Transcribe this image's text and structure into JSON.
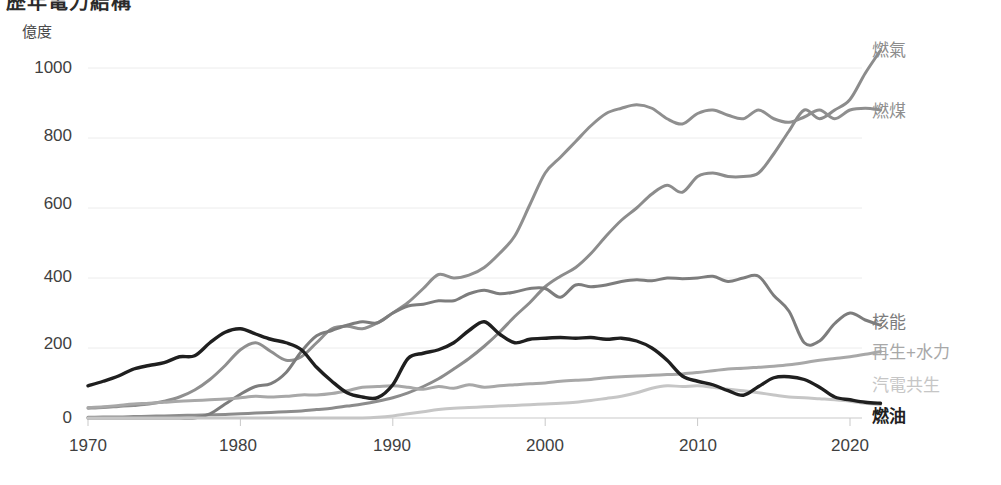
{
  "chart_title": "歷年電力結構",
  "axis_unit": "億度",
  "chart_data": {
    "type": "line",
    "title": "歷年電力結構",
    "xlabel": "",
    "ylabel": "億度",
    "ylim": [
      0,
      1100
    ],
    "xlim": [
      1970,
      2022
    ],
    "grid": true,
    "legend_position": "right-end-of-line",
    "yticks": [
      0,
      200,
      400,
      600,
      800,
      1000
    ],
    "xticks": [
      1970,
      1980,
      1990,
      2000,
      2010,
      2020
    ],
    "x": [
      1970,
      1971,
      1972,
      1973,
      1974,
      1975,
      1976,
      1977,
      1978,
      1979,
      1980,
      1981,
      1982,
      1983,
      1984,
      1985,
      1986,
      1987,
      1988,
      1989,
      1990,
      1991,
      1992,
      1993,
      1994,
      1995,
      1996,
      1997,
      1998,
      1999,
      2000,
      2001,
      2002,
      2003,
      2004,
      2005,
      2006,
      2007,
      2008,
      2009,
      2010,
      2011,
      2012,
      2013,
      2014,
      2015,
      2016,
      2017,
      2018,
      2019,
      2020,
      2021,
      2022
    ],
    "series": [
      {
        "name": "燃氣",
        "color": "#8c8c8c",
        "values": [
          2,
          3,
          3,
          4,
          5,
          6,
          7,
          8,
          9,
          10,
          12,
          14,
          16,
          18,
          20,
          24,
          28,
          34,
          40,
          48,
          58,
          72,
          90,
          112,
          140,
          170,
          205,
          245,
          290,
          330,
          375,
          405,
          430,
          470,
          520,
          565,
          600,
          640,
          665,
          645,
          690,
          700,
          690,
          690,
          700,
          755,
          820,
          880,
          855,
          880,
          910,
          985,
          1050
        ]
      },
      {
        "name": "燃煤",
        "color": "#8f8f8f",
        "values": [
          28,
          30,
          33,
          36,
          40,
          48,
          60,
          80,
          110,
          150,
          195,
          215,
          190,
          165,
          175,
          215,
          255,
          262,
          255,
          272,
          300,
          330,
          370,
          410,
          400,
          408,
          430,
          470,
          520,
          610,
          700,
          745,
          790,
          835,
          870,
          885,
          895,
          885,
          855,
          840,
          870,
          880,
          865,
          855,
          880,
          855,
          845,
          860,
          880,
          855,
          880,
          885,
          880
        ]
      },
      {
        "name": "核能",
        "color": "#7d7d7d",
        "values": [
          0,
          0,
          0,
          0,
          0,
          0,
          0,
          0,
          12,
          40,
          68,
          90,
          98,
          130,
          190,
          235,
          250,
          265,
          275,
          272,
          300,
          320,
          325,
          335,
          335,
          355,
          365,
          355,
          360,
          370,
          370,
          345,
          380,
          375,
          380,
          390,
          395,
          392,
          400,
          398,
          400,
          405,
          390,
          400,
          405,
          350,
          305,
          215,
          220,
          270,
          300,
          280,
          265
        ]
      },
      {
        "name": "再生+水力",
        "color": "#a8a8a8",
        "values": [
          30,
          32,
          36,
          40,
          42,
          45,
          48,
          50,
          52,
          54,
          58,
          62,
          60,
          62,
          66,
          66,
          70,
          78,
          88,
          90,
          92,
          88,
          82,
          90,
          85,
          95,
          88,
          92,
          95,
          98,
          100,
          105,
          108,
          110,
          115,
          118,
          120,
          122,
          124,
          126,
          130,
          135,
          140,
          142,
          145,
          148,
          152,
          158,
          165,
          170,
          175,
          182,
          190
        ]
      },
      {
        "name": "汽電共生",
        "color": "#c6c6c6",
        "values": [
          0,
          0,
          0,
          0,
          0,
          0,
          0,
          0,
          0,
          0,
          0,
          0,
          0,
          0,
          0,
          0,
          0,
          0,
          0,
          2,
          6,
          12,
          18,
          24,
          28,
          30,
          32,
          34,
          36,
          38,
          40,
          42,
          45,
          50,
          56,
          62,
          72,
          85,
          92,
          90,
          92,
          88,
          82,
          78,
          72,
          66,
          60,
          58,
          55,
          52,
          48,
          42,
          38
        ]
      },
      {
        "name": "燃油",
        "color": "#1f1f1f",
        "values": [
          92,
          105,
          120,
          140,
          150,
          158,
          175,
          178,
          215,
          245,
          255,
          240,
          225,
          215,
          195,
          145,
          105,
          72,
          60,
          58,
          95,
          170,
          185,
          195,
          215,
          250,
          275,
          240,
          215,
          225,
          228,
          230,
          228,
          230,
          225,
          228,
          220,
          200,
          165,
          120,
          105,
          95,
          78,
          65,
          90,
          115,
          118,
          110,
          88,
          60,
          52,
          45,
          42
        ]
      }
    ]
  },
  "y_axis": {
    "ticks": [
      {
        "label": "1000",
        "top": 58
      },
      {
        "label": "800",
        "top": 126
      },
      {
        "label": "600",
        "top": 194
      },
      {
        "label": "400",
        "top": 267
      },
      {
        "label": "200",
        "top": 334
      },
      {
        "label": "0",
        "top": 408
      }
    ]
  },
  "x_axis": {
    "ticks": [
      {
        "label": "1970",
        "left": 43
      },
      {
        "label": "1980",
        "left": 193
      },
      {
        "label": "1990",
        "left": 347
      },
      {
        "label": "2000",
        "left": 500
      },
      {
        "label": "2010",
        "left": 653
      },
      {
        "label": "2020",
        "left": 805
      }
    ]
  },
  "legend": [
    {
      "label": "燃氣",
      "cls": "legend-gas",
      "left": 872,
      "top": 42
    },
    {
      "label": "燃煤",
      "cls": "legend-coal",
      "left": 872,
      "top": 103
    },
    {
      "label": "核能",
      "cls": "legend-nuc",
      "left": 872,
      "top": 314
    },
    {
      "label": "再生+水力",
      "cls": "legend-ren",
      "left": 872,
      "top": 344
    },
    {
      "label": "汽電共生",
      "cls": "legend-cog",
      "left": 872,
      "top": 377
    },
    {
      "label": "燃油",
      "cls": "legend-oil",
      "left": 872,
      "top": 408
    }
  ]
}
